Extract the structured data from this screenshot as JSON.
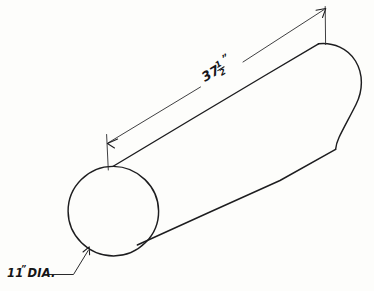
{
  "drawing": {
    "title": "Cylinder isometric sketch",
    "background_color": "#fdfdfb",
    "ink_color": "#1d1d1f",
    "length_dimension": {
      "whole": "37",
      "fraction_numerator": "1",
      "fraction_denominator": "2",
      "unit_mark": "”",
      "full_text": "37 1/2\"",
      "label_name": "length-dimension"
    },
    "diameter_note": {
      "value": "11",
      "unit_mark": "”",
      "abbreviation": "DIA.",
      "full_text": "11\" DIA.",
      "label_name": "diameter-note"
    },
    "parts": {
      "cylinder_body": "cylinder-body",
      "left_end_circle": "left-end-face-circle",
      "right_end_cap": "right-end-cap-arc",
      "top_edge": "cylinder-top-edge",
      "bottom_edge": "cylinder-bottom-edge",
      "dimension_line": "length-dimension-line",
      "extension_line_left": "extension-line-left",
      "extension_line_right": "extension-line-right",
      "arrow_left": "dimension-arrow-left",
      "arrow_right": "dimension-arrow-right",
      "leader": "diameter-leader-line",
      "leader_arrow": "diameter-leader-arrow"
    }
  }
}
